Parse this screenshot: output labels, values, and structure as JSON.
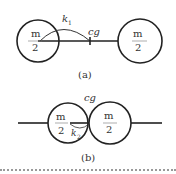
{
  "figure_a": {
    "left_mass": {
      "numerator": "m",
      "denominator": "2"
    },
    "right_mass": {
      "numerator": "m",
      "denominator": "2"
    },
    "radius_label": "k",
    "radius_subscript": "1",
    "cg_label": "cg",
    "caption": "(a)"
  },
  "figure_b": {
    "left_mass": {
      "numerator": "m",
      "denominator": "2"
    },
    "right_mass": {
      "numerator": "m",
      "denominator": "2"
    },
    "radius_label": "k",
    "radius_subscript": "2",
    "cg_label": "cg",
    "caption": "(b)"
  },
  "colors": {
    "stroke": "#222222",
    "text": "#333333",
    "divider": "#999999"
  }
}
